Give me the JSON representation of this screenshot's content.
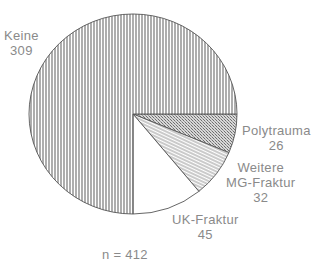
{
  "chart_data": {
    "type": "pie",
    "title": "",
    "total_label": "n = 412",
    "total": 412,
    "slices": [
      {
        "label": "Keine",
        "value": 309,
        "pattern": "vertical-lines"
      },
      {
        "label": "Polytrauma",
        "value": 26,
        "pattern": "crosshatch-dense"
      },
      {
        "label": "Weitere MG-Fraktur",
        "label_lines": [
          "Weitere",
          "MG-Fraktur"
        ],
        "value": 32,
        "pattern": "diagonal-lines"
      },
      {
        "label": "UK-Fraktur",
        "value": 45,
        "pattern": "blank"
      }
    ],
    "start_angle_deg": 0,
    "direction": "clockwise-for-minor-slices",
    "legend": "none (direct labels)"
  },
  "labels": {
    "keine": {
      "name": "Keine",
      "value": "309"
    },
    "poly": {
      "name": "Polytrauma",
      "value": "26"
    },
    "weitere": {
      "line1": "Weitere",
      "line2": "MG-Fraktur",
      "value": "32"
    },
    "uk": {
      "name": "UK-Fraktur",
      "value": "45"
    },
    "n": "n = 412"
  }
}
